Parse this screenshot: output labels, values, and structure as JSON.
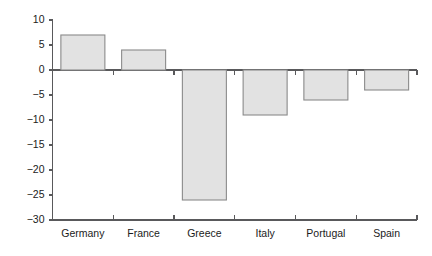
{
  "chart_data": {
    "type": "bar",
    "title": "",
    "subtitle": "",
    "xlabel": "",
    "ylabel": "",
    "categories": [
      "Germany",
      "France",
      "Greece",
      "Italy",
      "Portugal",
      "Spain"
    ],
    "values": [
      7,
      4,
      -26,
      -9,
      -6,
      -4
    ],
    "series": [
      {
        "name": "",
        "values": [
          7,
          4,
          -26,
          -9,
          -6,
          -4
        ]
      }
    ],
    "ylim": [
      -30,
      10
    ],
    "ytick_labels": [
      "10",
      "5",
      "0",
      "−5",
      "−10",
      "−15",
      "−20",
      "−25",
      "−30"
    ],
    "ytick_values": [
      10,
      5,
      0,
      -5,
      -10,
      -15,
      -20,
      -25,
      -30
    ],
    "grid": false,
    "legend": false,
    "legend_position": "none",
    "annotations": [],
    "colors": {
      "bar_fill": "#e2e2e2",
      "bar_stroke": "#8a8a8a",
      "axis": "#59595b",
      "text": "#1b1b1b",
      "background": "#ffffff"
    }
  }
}
